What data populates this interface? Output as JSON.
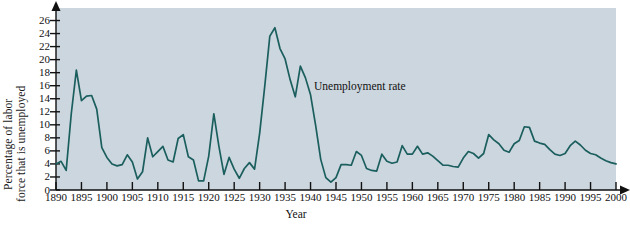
{
  "chart_data": {
    "type": "line",
    "title": "",
    "xlabel": "Year",
    "ylabel_line1": "Percentage of labor",
    "ylabel_line2": "force that is unemployed",
    "annotation": "Unemployment rate",
    "xlim": [
      1890,
      2000
    ],
    "ylim": [
      0,
      27
    ],
    "grid": false,
    "legend": "none",
    "line_color": "#1b5e5e",
    "plot_background": "#ccd6de",
    "page_background": "#ffffff",
    "x_ticks": [
      1890,
      1895,
      1900,
      1905,
      1910,
      1915,
      1920,
      1925,
      1930,
      1935,
      1940,
      1945,
      1950,
      1955,
      1960,
      1965,
      1970,
      1975,
      1980,
      1985,
      1990,
      1995,
      2000
    ],
    "y_ticks": [
      0,
      2,
      4,
      6,
      8,
      10,
      12,
      14,
      16,
      18,
      20,
      22,
      24,
      26
    ],
    "series": [
      {
        "name": "Unemployment rate",
        "x": [
          1890,
          1891,
          1892,
          1893,
          1894,
          1895,
          1896,
          1897,
          1898,
          1899,
          1900,
          1901,
          1902,
          1903,
          1904,
          1905,
          1906,
          1907,
          1908,
          1909,
          1910,
          1911,
          1912,
          1913,
          1914,
          1915,
          1916,
          1917,
          1918,
          1919,
          1920,
          1921,
          1922,
          1923,
          1924,
          1925,
          1926,
          1927,
          1928,
          1929,
          1930,
          1931,
          1932,
          1933,
          1934,
          1935,
          1936,
          1937,
          1938,
          1939,
          1940,
          1941,
          1942,
          1943,
          1944,
          1945,
          1946,
          1947,
          1948,
          1949,
          1950,
          1951,
          1952,
          1953,
          1954,
          1955,
          1956,
          1957,
          1958,
          1959,
          1960,
          1961,
          1962,
          1963,
          1964,
          1965,
          1966,
          1967,
          1968,
          1969,
          1970,
          1971,
          1972,
          1973,
          1974,
          1975,
          1976,
          1977,
          1978,
          1979,
          1980,
          1981,
          1982,
          1983,
          1984,
          1985,
          1986,
          1987,
          1988,
          1989,
          1990,
          1991,
          1992,
          1993,
          1994,
          1995,
          1996,
          1997,
          1998,
          1999,
          2000
        ],
        "values": [
          4.0,
          4.4,
          3.0,
          11.7,
          18.4,
          13.7,
          14.4,
          14.5,
          12.4,
          6.5,
          5.0,
          4.0,
          3.7,
          3.9,
          5.4,
          4.3,
          1.7,
          2.8,
          8.0,
          5.1,
          5.9,
          6.7,
          4.6,
          4.3,
          7.9,
          8.5,
          5.1,
          4.6,
          1.4,
          1.4,
          5.2,
          11.7,
          6.7,
          2.4,
          5.0,
          3.2,
          1.8,
          3.3,
          4.2,
          3.2,
          8.7,
          15.9,
          23.6,
          24.9,
          21.7,
          20.1,
          16.9,
          14.3,
          19.0,
          17.2,
          14.6,
          9.9,
          4.7,
          1.9,
          1.2,
          1.9,
          3.9,
          3.9,
          3.8,
          5.9,
          5.3,
          3.3,
          3.0,
          2.9,
          5.5,
          4.4,
          4.1,
          4.3,
          6.8,
          5.5,
          5.5,
          6.7,
          5.5,
          5.7,
          5.2,
          4.5,
          3.8,
          3.8,
          3.6,
          3.5,
          4.9,
          5.9,
          5.6,
          4.9,
          5.6,
          8.5,
          7.7,
          7.1,
          6.1,
          5.8,
          7.1,
          7.6,
          9.7,
          9.6,
          7.5,
          7.2,
          7.0,
          6.2,
          5.5,
          5.3,
          5.6,
          6.8,
          7.5,
          6.9,
          6.1,
          5.6,
          5.4,
          4.9,
          4.5,
          4.2,
          4.0
        ]
      }
    ]
  }
}
